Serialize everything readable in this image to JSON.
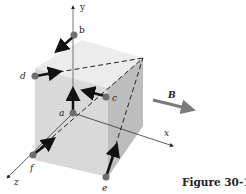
{
  "figure": {
    "caption": "Figure 30-11",
    "field_label": "B",
    "axes": {
      "x": "x",
      "y": "y",
      "z": "z"
    },
    "points": [
      {
        "id": "a",
        "label": "a"
      },
      {
        "id": "b",
        "label": "b"
      },
      {
        "id": "c",
        "label": "c"
      },
      {
        "id": "d",
        "label": "d"
      },
      {
        "id": "e",
        "label": "e"
      },
      {
        "id": "f",
        "label": "f"
      }
    ],
    "colors": {
      "cube_top": "#ececec",
      "cube_front": "#d9d9d9",
      "cube_right": "#bdbdbd",
      "point": "#6e6e6e",
      "arrow": "#111111",
      "field_arrow": "#7a7a7a"
    }
  }
}
